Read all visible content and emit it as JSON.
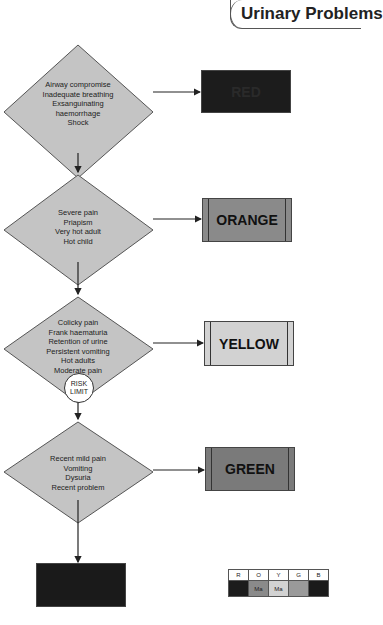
{
  "title": "Urinary Problems",
  "colors": {
    "red": "#1c1c1c",
    "orange": "#8a8a8a",
    "yellow": "#d2d2d2",
    "green": "#7a7a7a",
    "blue": "#1a1a1a",
    "diamond": "#c4c4c4"
  },
  "nodes": [
    {
      "id": "d1",
      "type": "decision",
      "lines": [
        "Airway compromise",
        "Inadequate breathing",
        "Exsanguinating",
        "haemorrhage",
        "Shock"
      ],
      "outcome": {
        "label": "RED",
        "color": "#1c1c1c"
      }
    },
    {
      "id": "d2",
      "type": "decision",
      "lines": [
        "Severe pain",
        "Priapism",
        "Very hot adult",
        "Hot child"
      ],
      "outcome": {
        "label": "ORANGE",
        "color": "#8a8a8a"
      }
    },
    {
      "id": "d3",
      "type": "decision",
      "lines": [
        "Colicky pain",
        "Frank haematuria",
        "Retention of urine",
        "Persistent vomiting",
        "Hot adults",
        "Moderate pain"
      ],
      "outcome": {
        "label": "YELLOW",
        "color": "#d2d2d2"
      }
    },
    {
      "id": "d4",
      "type": "decision",
      "lines": [
        "Recent mild pain",
        "Vomiting",
        "Dysuria",
        "Recent problem"
      ],
      "outcome": {
        "label": "GREEN",
        "color": "#7a7a7a"
      }
    }
  ],
  "risk_limit": {
    "line1": "RISK",
    "line2": "LIMIT"
  },
  "final_box": {
    "label": "BLUE",
    "color": "#1a1a1a"
  },
  "legend": {
    "headers": [
      "R",
      "O",
      "Y",
      "G",
      "B"
    ],
    "cells": [
      "",
      "Ma",
      "Ma",
      "",
      ""
    ],
    "colors": [
      "#1c1c1c",
      "#8a8a8a",
      "#d2d2d2",
      "#9a9a9a",
      "#1a1a1a"
    ]
  }
}
